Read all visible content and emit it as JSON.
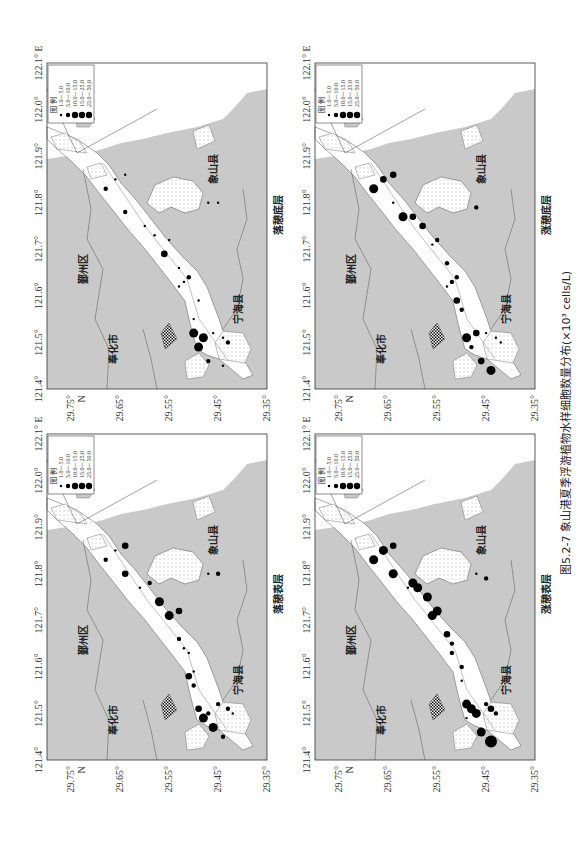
{
  "figure": {
    "caption": "图5.2-7  象山港夏季浮游植物水样细胞数量分布(×10³ cells/L)",
    "unit": "×10³ cells/L",
    "axes": {
      "longitude_ticks": [
        "121.4°",
        "121.5°",
        "121.6°",
        "121.7°",
        "121.8°",
        "121.9°",
        "122.0°",
        "122.1° E"
      ],
      "latitude_ticks": [
        "29.75°",
        "29.65°",
        "29.55°",
        "29.45°",
        "29.35°"
      ],
      "latitude_unit": "N"
    },
    "legend": {
      "title": "图 例",
      "classes": [
        "1.0－5.0",
        "5.0－10.0",
        "10.0－15.0",
        "15.0－25.0",
        "25.0－50.0"
      ],
      "radii": [
        1.2,
        2.2,
        3.3,
        4.5,
        6.0
      ]
    },
    "places": {
      "yinzhou": "鄞州区",
      "fenghua": "奉化市",
      "xiangshan": "象山县",
      "ninghai": "宁海县"
    },
    "panels": [
      {
        "id": "top-left",
        "label": "落憩底层"
      },
      {
        "id": "top-right",
        "label": "涨憩底层"
      },
      {
        "id": "bottom-left",
        "label": "落憩表层"
      },
      {
        "id": "bottom-right",
        "label": "涨憩表层"
      }
    ]
  },
  "chart_data": [
    {
      "type": "scatter",
      "title": "落憩底层",
      "xlabel": "Longitude (°E)",
      "ylabel": "Latitude (°N)",
      "xlim": [
        121.4,
        122.1
      ],
      "ylim": [
        29.35,
        29.8
      ],
      "size_classes": [
        "1.0-5.0",
        "5.0-10.0",
        "10.0-15.0",
        "15.0-25.0",
        "25.0-50.0"
      ],
      "points": [
        {
          "lon": 121.83,
          "lat": 29.68,
          "class": 2
        },
        {
          "lon": 121.85,
          "lat": 29.66,
          "class": 1
        },
        {
          "lon": 121.86,
          "lat": 29.64,
          "class": 1
        },
        {
          "lon": 121.78,
          "lat": 29.64,
          "class": 2
        },
        {
          "lon": 121.75,
          "lat": 29.6,
          "class": 1
        },
        {
          "lon": 121.73,
          "lat": 29.58,
          "class": 1
        },
        {
          "lon": 121.72,
          "lat": 29.55,
          "class": 1
        },
        {
          "lon": 121.69,
          "lat": 29.56,
          "class": 3
        },
        {
          "lon": 121.66,
          "lat": 29.53,
          "class": 1
        },
        {
          "lon": 121.64,
          "lat": 29.51,
          "class": 2
        },
        {
          "lon": 121.63,
          "lat": 29.52,
          "class": 1
        },
        {
          "lon": 121.62,
          "lat": 29.53,
          "class": 1
        },
        {
          "lon": 121.59,
          "lat": 29.49,
          "class": 1
        },
        {
          "lon": 121.55,
          "lat": 29.5,
          "class": 1
        },
        {
          "lon": 121.52,
          "lat": 29.5,
          "class": 4
        },
        {
          "lon": 121.51,
          "lat": 29.48,
          "class": 4
        },
        {
          "lon": 121.49,
          "lat": 29.49,
          "class": 4
        },
        {
          "lon": 121.52,
          "lat": 29.46,
          "class": 1
        },
        {
          "lon": 121.51,
          "lat": 29.44,
          "class": 1
        },
        {
          "lon": 121.5,
          "lat": 29.43,
          "class": 2
        },
        {
          "lon": 121.46,
          "lat": 29.47,
          "class": 2
        },
        {
          "lon": 121.45,
          "lat": 29.44,
          "class": 1
        },
        {
          "lon": 121.8,
          "lat": 29.47,
          "class": 1
        },
        {
          "lon": 121.8,
          "lat": 29.45,
          "class": 1
        }
      ]
    },
    {
      "type": "scatter",
      "title": "涨憩底层",
      "xlabel": "Longitude (°E)",
      "ylabel": "Latitude (°N)",
      "xlim": [
        121.4,
        122.1
      ],
      "ylim": [
        29.35,
        29.8
      ],
      "size_classes": [
        "1.0-5.0",
        "5.0-10.0",
        "10.0-15.0",
        "15.0-25.0",
        "25.0-50.0"
      ],
      "points": [
        {
          "lon": 121.83,
          "lat": 29.68,
          "class": 4
        },
        {
          "lon": 121.85,
          "lat": 29.66,
          "class": 3
        },
        {
          "lon": 121.86,
          "lat": 29.64,
          "class": 3
        },
        {
          "lon": 121.8,
          "lat": 29.64,
          "class": 1
        },
        {
          "lon": 121.77,
          "lat": 29.62,
          "class": 4
        },
        {
          "lon": 121.77,
          "lat": 29.6,
          "class": 3
        },
        {
          "lon": 121.75,
          "lat": 29.58,
          "class": 3
        },
        {
          "lon": 121.72,
          "lat": 29.55,
          "class": 2
        },
        {
          "lon": 121.71,
          "lat": 29.56,
          "class": 1
        },
        {
          "lon": 121.67,
          "lat": 29.53,
          "class": 2
        },
        {
          "lon": 121.64,
          "lat": 29.51,
          "class": 2
        },
        {
          "lon": 121.63,
          "lat": 29.52,
          "class": 2
        },
        {
          "lon": 121.62,
          "lat": 29.53,
          "class": 1
        },
        {
          "lon": 121.59,
          "lat": 29.51,
          "class": 3
        },
        {
          "lon": 121.57,
          "lat": 29.5,
          "class": 2
        },
        {
          "lon": 121.51,
          "lat": 29.49,
          "class": 4
        },
        {
          "lon": 121.52,
          "lat": 29.47,
          "class": 3
        },
        {
          "lon": 121.49,
          "lat": 29.48,
          "class": 2
        },
        {
          "lon": 121.52,
          "lat": 29.45,
          "class": 1
        },
        {
          "lon": 121.51,
          "lat": 29.43,
          "class": 1
        },
        {
          "lon": 121.5,
          "lat": 29.42,
          "class": 1
        },
        {
          "lon": 121.46,
          "lat": 29.46,
          "class": 3
        },
        {
          "lon": 121.44,
          "lat": 29.44,
          "class": 4
        },
        {
          "lon": 121.79,
          "lat": 29.47,
          "class": 2
        }
      ]
    },
    {
      "type": "scatter",
      "title": "落憩表层",
      "xlabel": "Longitude (°E)",
      "ylabel": "Latitude (°N)",
      "xlim": [
        121.4,
        122.1
      ],
      "ylim": [
        29.35,
        29.8
      ],
      "size_classes": [
        "1.0-5.0",
        "5.0-10.0",
        "10.0-15.0",
        "15.0-25.0",
        "25.0-50.0"
      ],
      "points": [
        {
          "lon": 121.83,
          "lat": 29.68,
          "class": 2
        },
        {
          "lon": 121.85,
          "lat": 29.66,
          "class": 1
        },
        {
          "lon": 121.86,
          "lat": 29.64,
          "class": 3
        },
        {
          "lon": 121.8,
          "lat": 29.64,
          "class": 3
        },
        {
          "lon": 121.77,
          "lat": 29.61,
          "class": 1
        },
        {
          "lon": 121.78,
          "lat": 29.59,
          "class": 2
        },
        {
          "lon": 121.74,
          "lat": 29.57,
          "class": 4
        },
        {
          "lon": 121.71,
          "lat": 29.55,
          "class": 4
        },
        {
          "lon": 121.72,
          "lat": 29.53,
          "class": 3
        },
        {
          "lon": 121.66,
          "lat": 29.53,
          "class": 2
        },
        {
          "lon": 121.64,
          "lat": 29.52,
          "class": 1
        },
        {
          "lon": 121.63,
          "lat": 29.51,
          "class": 1
        },
        {
          "lon": 121.59,
          "lat": 29.5,
          "class": 1
        },
        {
          "lon": 121.58,
          "lat": 29.51,
          "class": 3
        },
        {
          "lon": 121.56,
          "lat": 29.5,
          "class": 2
        },
        {
          "lon": 121.51,
          "lat": 29.49,
          "class": 3
        },
        {
          "lon": 121.49,
          "lat": 29.48,
          "class": 4
        },
        {
          "lon": 121.5,
          "lat": 29.47,
          "class": 2
        },
        {
          "lon": 121.52,
          "lat": 29.45,
          "class": 2
        },
        {
          "lon": 121.51,
          "lat": 29.43,
          "class": 2
        },
        {
          "lon": 121.5,
          "lat": 29.42,
          "class": 1
        },
        {
          "lon": 121.47,
          "lat": 29.46,
          "class": 4
        },
        {
          "lon": 121.45,
          "lat": 29.44,
          "class": 2
        },
        {
          "lon": 121.8,
          "lat": 29.47,
          "class": 1
        },
        {
          "lon": 121.8,
          "lat": 29.45,
          "class": 2
        }
      ]
    },
    {
      "type": "scatter",
      "title": "涨憩表层",
      "xlabel": "Longitude (°E)",
      "ylabel": "Latitude (°N)",
      "xlim": [
        121.4,
        122.1
      ],
      "ylim": [
        29.35,
        29.8
      ],
      "size_classes": [
        "1.0-5.0",
        "5.0-10.0",
        "10.0-15.0",
        "15.0-25.0",
        "25.0-50.0"
      ],
      "points": [
        {
          "lon": 121.83,
          "lat": 29.68,
          "class": 4
        },
        {
          "lon": 121.85,
          "lat": 29.66,
          "class": 4
        },
        {
          "lon": 121.86,
          "lat": 29.64,
          "class": 3
        },
        {
          "lon": 121.8,
          "lat": 29.64,
          "class": 4
        },
        {
          "lon": 121.77,
          "lat": 29.61,
          "class": 1
        },
        {
          "lon": 121.78,
          "lat": 29.6,
          "class": 4
        },
        {
          "lon": 121.77,
          "lat": 29.59,
          "class": 4
        },
        {
          "lon": 121.75,
          "lat": 29.57,
          "class": 4
        },
        {
          "lon": 121.72,
          "lat": 29.55,
          "class": 4
        },
        {
          "lon": 121.71,
          "lat": 29.56,
          "class": 4
        },
        {
          "lon": 121.67,
          "lat": 29.53,
          "class": 3
        },
        {
          "lon": 121.65,
          "lat": 29.52,
          "class": 2
        },
        {
          "lon": 121.63,
          "lat": 29.52,
          "class": 2
        },
        {
          "lon": 121.6,
          "lat": 29.5,
          "class": 2
        },
        {
          "lon": 121.57,
          "lat": 29.5,
          "class": 1
        },
        {
          "lon": 121.52,
          "lat": 29.49,
          "class": 4
        },
        {
          "lon": 121.51,
          "lat": 29.48,
          "class": 4
        },
        {
          "lon": 121.5,
          "lat": 29.47,
          "class": 4
        },
        {
          "lon": 121.49,
          "lat": 29.49,
          "class": 1
        },
        {
          "lon": 121.52,
          "lat": 29.45,
          "class": 2
        },
        {
          "lon": 121.51,
          "lat": 29.44,
          "class": 3
        },
        {
          "lon": 121.5,
          "lat": 29.43,
          "class": 2
        },
        {
          "lon": 121.46,
          "lat": 29.46,
          "class": 4
        },
        {
          "lon": 121.44,
          "lat": 29.44,
          "class": 5
        },
        {
          "lon": 121.8,
          "lat": 29.47,
          "class": 1
        },
        {
          "lon": 121.79,
          "lat": 29.45,
          "class": 2
        }
      ]
    }
  ]
}
